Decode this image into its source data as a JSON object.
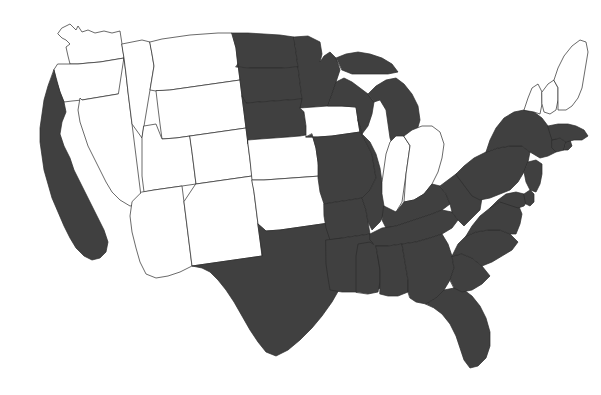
{
  "map": {
    "title": "United States Choropleth Map",
    "description": "Outline map of the contiguous United States with a subset of states shaded dark gray",
    "background_color": "#ffffff",
    "fill_color": "#404040",
    "unfilled_color": "#ffffff",
    "border_color": "#2b2b2b",
    "projection": "albers-usa-like",
    "width": 601,
    "height": 395,
    "legend_visible": false,
    "labels_visible": false
  },
  "chart_data": {
    "type": "choropleth",
    "xlabel": "",
    "ylabel": "",
    "categories": [
      "selected",
      "not selected"
    ],
    "value_colors": {
      "selected": "#404040",
      "not selected": "#ffffff"
    },
    "selected_count": 30,
    "unselected_count": 18,
    "regions": [
      {
        "code": "WA",
        "name": "Washington",
        "selected": false,
        "value": 0
      },
      {
        "code": "OR",
        "name": "Oregon",
        "selected": false,
        "value": 0
      },
      {
        "code": "CA",
        "name": "California",
        "selected": true,
        "value": 1
      },
      {
        "code": "NV",
        "name": "Nevada",
        "selected": false,
        "value": 0
      },
      {
        "code": "ID",
        "name": "Idaho",
        "selected": false,
        "value": 0
      },
      {
        "code": "MT",
        "name": "Montana",
        "selected": false,
        "value": 0
      },
      {
        "code": "WY",
        "name": "Wyoming",
        "selected": false,
        "value": 0
      },
      {
        "code": "UT",
        "name": "Utah",
        "selected": false,
        "value": 0
      },
      {
        "code": "CO",
        "name": "Colorado",
        "selected": false,
        "value": 0
      },
      {
        "code": "AZ",
        "name": "Arizona",
        "selected": false,
        "value": 0
      },
      {
        "code": "NM",
        "name": "New Mexico",
        "selected": false,
        "value": 0
      },
      {
        "code": "ND",
        "name": "North Dakota",
        "selected": true,
        "value": 1
      },
      {
        "code": "SD",
        "name": "South Dakota",
        "selected": true,
        "value": 1
      },
      {
        "code": "NE",
        "name": "Nebraska",
        "selected": true,
        "value": 1
      },
      {
        "code": "KS",
        "name": "Kansas",
        "selected": false,
        "value": 0
      },
      {
        "code": "OK",
        "name": "Oklahoma",
        "selected": false,
        "value": 0
      },
      {
        "code": "TX",
        "name": "Texas",
        "selected": true,
        "value": 1
      },
      {
        "code": "MN",
        "name": "Minnesota",
        "selected": true,
        "value": 1
      },
      {
        "code": "IA",
        "name": "Iowa",
        "selected": false,
        "value": 0
      },
      {
        "code": "MO",
        "name": "Missouri",
        "selected": true,
        "value": 1
      },
      {
        "code": "AR",
        "name": "Arkansas",
        "selected": true,
        "value": 1
      },
      {
        "code": "LA",
        "name": "Louisiana",
        "selected": true,
        "value": 1
      },
      {
        "code": "WI",
        "name": "Wisconsin",
        "selected": true,
        "value": 1
      },
      {
        "code": "IL",
        "name": "Illinois",
        "selected": true,
        "value": 1
      },
      {
        "code": "MI",
        "name": "Michigan",
        "selected": true,
        "value": 1
      },
      {
        "code": "IN",
        "name": "Indiana",
        "selected": false,
        "value": 0
      },
      {
        "code": "OH",
        "name": "Ohio",
        "selected": false,
        "value": 0
      },
      {
        "code": "KY",
        "name": "Kentucky",
        "selected": true,
        "value": 1
      },
      {
        "code": "TN",
        "name": "Tennessee",
        "selected": true,
        "value": 1
      },
      {
        "code": "MS",
        "name": "Mississippi",
        "selected": true,
        "value": 1
      },
      {
        "code": "AL",
        "name": "Alabama",
        "selected": true,
        "value": 1
      },
      {
        "code": "GA",
        "name": "Georgia",
        "selected": true,
        "value": 1
      },
      {
        "code": "FL",
        "name": "Florida",
        "selected": true,
        "value": 1
      },
      {
        "code": "SC",
        "name": "South Carolina",
        "selected": true,
        "value": 1
      },
      {
        "code": "NC",
        "name": "North Carolina",
        "selected": true,
        "value": 1
      },
      {
        "code": "VA",
        "name": "Virginia",
        "selected": true,
        "value": 1
      },
      {
        "code": "WV",
        "name": "West Virginia",
        "selected": true,
        "value": 1
      },
      {
        "code": "MD",
        "name": "Maryland",
        "selected": true,
        "value": 1
      },
      {
        "code": "DE",
        "name": "Delaware",
        "selected": true,
        "value": 1
      },
      {
        "code": "PA",
        "name": "Pennsylvania",
        "selected": true,
        "value": 1
      },
      {
        "code": "NJ",
        "name": "New Jersey",
        "selected": true,
        "value": 1
      },
      {
        "code": "NY",
        "name": "New York",
        "selected": true,
        "value": 1
      },
      {
        "code": "CT",
        "name": "Connecticut",
        "selected": true,
        "value": 1
      },
      {
        "code": "RI",
        "name": "Rhode Island",
        "selected": true,
        "value": 1
      },
      {
        "code": "MA",
        "name": "Massachusetts",
        "selected": true,
        "value": 1
      },
      {
        "code": "VT",
        "name": "Vermont",
        "selected": false,
        "value": 0
      },
      {
        "code": "NH",
        "name": "New Hampshire",
        "selected": false,
        "value": 0
      },
      {
        "code": "ME",
        "name": "Maine",
        "selected": false,
        "value": 0
      }
    ]
  },
  "geometry": {
    "WA": "M62,28 L70,24 L76,30 L78,26 L82,32 L88,30 L95,33 L104,31 L112,33 L120,31 L122,44 L124,58 L112,60 L100,62 L88,63 L78,64 L70,64 L68,56 L66,47 L70,44 L66,40 L62,38 L58,34 Z",
    "OR": "M58,64 L70,64 L78,64 L88,63 L100,62 L112,60 L124,58 L126,74 L128,92 L118,94 L106,96 L94,98 L82,100 L72,101 L64,102 L60,92 L56,80 L54,70 Z",
    "CA": "M54,70 L60,92 L64,102 L66,112 L62,122 L60,134 L64,146 L70,158 L74,170 L80,182 L86,194 L92,206 L98,218 L104,230 L108,242 L106,252 L100,258 L92,260 L84,256 L76,248 L70,238 L64,226 L58,212 L52,198 L48,184 L44,170 L42,156 L40,142 L40,128 L42,114 L44,100 L48,86 Z",
    "NV": "M124,58 L126,74 L128,92 L130,108 L132,124 L134,140 L136,156 L138,172 L140,188 L142,204 L130,206 L120,200 L112,192 L106,182 L100,170 L94,158 L88,146 L84,134 L80,122 L78,110 L80,98 L82,100 L94,98 L106,96 L118,94 Z",
    "ID": "M122,44 L132,42 L142,40 L150,42 L152,54 L154,66 L152,78 L150,90 L148,102 L146,114 L144,126 L142,138 L132,124 L130,108 L128,92 L126,74 L124,58 Z",
    "MT": "M150,42 L162,39 L176,37 L190,35 L204,34 L218,33 L232,33 L236,48 L238,64 L240,80 L226,82 L212,84 L198,86 L184,88 L170,90 L156,91 L150,90 L152,78 L154,66 L152,54 Z",
    "WY": "M170,90 L184,88 L198,86 L212,84 L226,82 L240,80 L242,96 L244,112 L246,128 L232,130 L218,132 L204,134 L190,136 L176,138 L162,139 L160,124 L158,108 L156,91 Z",
    "UT": "M144,126 L156,124 L162,139 L176,138 L190,136 L192,152 L194,168 L196,184 L182,186 L168,188 L154,190 L144,192 L142,176 L142,160 L142,138 Z",
    "CO": "M190,136 L204,134 L218,132 L232,130 L246,128 L248,144 L250,160 L252,176 L238,178 L224,180 L210,182 L196,184 L194,168 L192,152 Z",
    "AZ": "M142,192 L154,190 L168,188 L182,186 L184,202 L186,218 L188,234 L190,250 L192,266 L180,272 L168,276 L156,278 L146,274 L140,262 L136,248 L132,232 L130,216 L132,202 Z",
    "NM": "M196,184 L210,182 L224,180 L238,178 L252,176 L254,192 L256,208 L258,224 L260,240 L262,256 L248,258 L234,260 L220,262 L206,264 L192,266 L190,250 L188,234 L186,218 L184,202 Z",
    "ND": "M232,33 L248,33 L264,34 L280,35 L294,37 L296,52 L298,67 L282,68 L266,68 L250,68 L238,67 L236,48 Z",
    "SD": "M236,67 L250,68 L266,68 L282,68 L298,67 L300,83 L302,99 L288,100 L274,101 L260,102 L246,103 L242,96 L240,80 L238,64 Z",
    "NE": "M242,96 L246,103 L260,102 L274,101 L288,100 L302,99 L304,112 L306,126 L312,134 L300,136 L288,137 L274,138 L260,139 L248,140 L248,144 L246,128 L244,112 Z",
    "KS": "M248,140 L260,139 L274,138 L288,137 L300,136 L312,134 L316,148 L318,162 L320,176 L306,177 L292,178 L278,179 L264,180 L252,180 L250,160 L248,144 Z",
    "OK": "M252,180 L264,180 L278,179 L292,178 L306,177 L320,176 L324,186 L326,198 L330,210 L336,222 L322,224 L308,226 L294,228 L280,230 L266,231 L258,224 L256,208 L254,192 Z",
    "TX": "M258,224 L266,231 L280,230 L294,228 L308,226 L322,224 L336,222 L340,234 L344,248 L348,260 L346,274 L340,288 L332,302 L322,316 L312,328 L300,340 L288,350 L276,356 L266,352 L258,342 L250,330 L242,316 L234,302 L226,290 L218,280 L210,272 L202,268 L192,266 L206,264 L220,262 L234,260 L248,258 L262,256 Z",
    "MN": "M294,37 L308,36 L320,42 L322,54 L320,62 L324,56 L330,52 L336,58 L340,70 L336,82 L332,94 L328,106 L314,107 L300,108 L302,99 L300,83 L298,67 L296,52 Z",
    "IA": "M300,108 L314,107 L328,106 L342,106 L356,107 L358,120 L360,132 L346,134 L332,136 L318,137 L306,137 L306,126 L304,112 Z",
    "MO": "M306,137 L318,137 L332,136 L346,134 L360,132 L366,142 L372,154 L374,166 L376,178 L370,190 L362,198 L350,200 L336,202 L324,204 L320,192 L318,178 L318,162 L316,148 L312,134 Z",
    "AR": "M324,204 L336,202 L350,200 L362,198 L366,210 L368,222 L370,234 L356,236 L342,238 L330,240 L326,228 L324,216 Z",
    "LA": "M326,240 L342,238 L356,236 L370,234 L374,246 L378,258 L384,268 L396,272 L394,282 L382,288 L370,290 L356,292 L342,292 L330,290 L328,278 L326,264 Z",
    "WI": "M332,94 L336,82 L344,78 L352,82 L360,88 L368,94 L374,102 L372,114 L368,126 L362,134 L358,120 L356,107 L342,106 L328,106 Z",
    "IL": "M358,120 L362,134 L370,142 L376,154 L380,168 L382,182 L384,196 L386,210 L380,222 L372,230 L368,222 L366,210 L362,198 L370,190 L376,178 L374,166 L372,154 L366,142 L360,132 Z",
    "MI": "M368,94 L376,86 L386,80 L396,78 L404,84 L412,94 L418,106 L420,120 L416,134 L410,146 L402,154 L394,150 L390,138 L388,124 L386,110 L380,100 L374,102 Z",
    "MI-up": "M336,58 L346,54 L358,52 L370,54 L382,58 L392,64 L398,72 L388,74 L376,74 L364,74 L352,74 L342,70 Z",
    "IN": "M382,182 L384,168 L386,154 L390,142 L396,136 L404,136 L410,146 L408,160 L406,174 L404,188 L402,202 L396,212 L388,216 L384,206 L382,194 Z",
    "OH": "M404,136 L412,130 L422,126 L432,126 L440,132 L444,144 L442,158 L438,172 L432,184 L424,194 L414,200 L404,202 L406,174 L408,160 L410,146 Z",
    "KY": "M384,206 L396,212 L404,202 L414,200 L424,194 L432,184 L440,186 L446,194 L450,204 L442,210 L432,214 L420,218 L408,222 L396,226 L386,228 L382,220 Z",
    "TN": "M370,234 L382,228 L396,226 L408,222 L420,218 L432,214 L442,210 L452,212 L458,220 L452,228 L442,234 L430,238 L416,242 L402,244 L388,246 L376,246 L370,240 Z",
    "MS": "M356,292 L356,280 L356,268 L356,256 L358,244 L370,242 L376,246 L378,258 L380,270 L380,282 L378,292 L368,294 Z",
    "AL": "M380,282 L380,270 L378,258 L376,246 L388,246 L402,244 L404,256 L406,268 L408,280 L408,292 L398,296 L388,296 L380,294 Z",
    "GA": "M408,292 L408,280 L406,268 L404,256 L402,244 L416,242 L430,238 L442,234 L448,244 L452,256 L454,268 L450,280 L444,290 L436,298 L426,304 L416,302 L410,298 Z",
    "FL": "M426,304 L436,298 L444,290 L454,288 L464,290 L472,296 L480,306 L486,318 L490,332 L490,346 L486,358 L478,366 L470,368 L464,360 L460,348 L456,336 L450,324 L442,314 L434,308 Z",
    "SC": "M450,280 L454,268 L452,256 L462,254 L472,258 L482,266 L490,276 L482,284 L472,290 L462,292 L454,288 Z",
    "NC": "M452,256 L458,244 L466,236 L476,232 L488,230 L500,230 L510,234 L518,242 L512,250 L502,256 L492,262 L482,266 L472,258 L462,254 Z",
    "VA": "M466,236 L472,226 L480,216 L490,208 L500,202 L510,200 L518,204 L522,214 L520,224 L516,234 L510,234 L500,230 L488,230 L476,232 Z",
    "WV": "M440,186 L448,180 L456,174 L464,172 L472,176 L478,186 L482,198 L480,210 L472,218 L464,226 L458,220 L452,212 L450,204 L446,194 Z",
    "MD": "M490,208 L498,200 L506,194 L516,192 L524,194 L528,200 L524,206 L518,208 L512,206 L506,204 L500,202 Z",
    "DE": "M524,194 L530,190 L534,194 L534,202 L530,206 L526,204 Z",
    "PA": "M456,174 L464,166 L474,158 L486,152 L498,148 L510,146 L522,146 L530,152 L528,162 L524,172 L518,182 L510,190 L500,194 L490,198 L480,200 L472,196 L466,188 Z",
    "NJ": "M528,162 L536,160 L542,164 L542,174 L540,184 L536,192 L530,190 L526,182 L524,172 Z",
    "NY": "M486,152 L490,140 L496,128 L504,118 L514,112 L524,110 L534,112 L542,118 L548,126 L554,136 L560,144 L556,152 L548,156 L540,158 L530,152 L522,146 L510,146 L498,148 Z",
    "CT": "M552,140 L560,138 L566,142 L564,150 L556,152 L552,148 Z",
    "RI": "M566,142 L570,140 L572,146 L568,150 L564,150 Z",
    "MA": "M548,126 L558,124 L568,124 L576,126 L584,130 L588,136 L582,140 L574,140 L566,142 L560,138 L552,140 L550,134 Z",
    "VT": "M524,110 L528,98 L532,88 L538,84 L542,92 L542,104 L540,114 L534,112 Z",
    "NH": "M542,92 L548,84 L554,80 L558,88 L558,100 L556,110 L550,114 L544,112 L542,104 Z",
    "ME": "M554,80 L558,68 L564,56 L572,46 L580,40 L586,42 L588,52 L586,64 L584,76 L582,88 L578,98 L572,106 L566,110 L558,110 L558,100 L558,88 Z"
  }
}
